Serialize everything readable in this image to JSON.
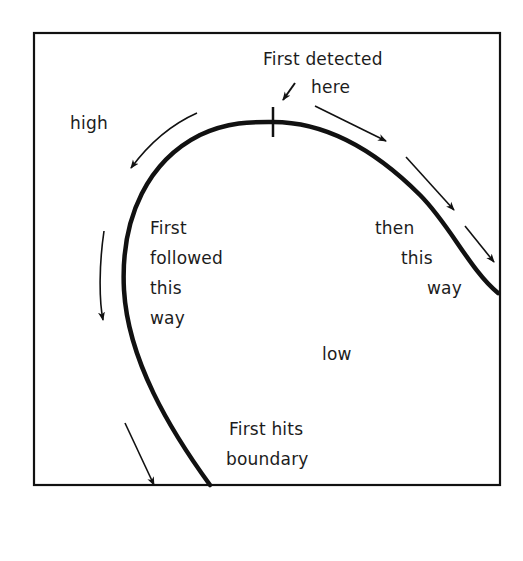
{
  "diagram": {
    "title": "",
    "labels": {
      "high": "high",
      "low": "low",
      "first_detected": [
        "First detected",
        "here"
      ],
      "first_followed": [
        "First",
        "followed",
        "this",
        "way"
      ],
      "then_this_way": [
        "then",
        "this",
        "way"
      ],
      "first_hits_boundary": [
        "First hits",
        "boundary"
      ]
    },
    "elements": {
      "frame": "bounding-box",
      "curve": "contour-line",
      "tick_mark": "detection-point-marker",
      "arrows": [
        "arrow-detection-pointer",
        "arrow-left-upper",
        "arrow-left-middle",
        "arrow-left-lower",
        "arrow-right-upper",
        "arrow-right-middle",
        "arrow-right-lower"
      ]
    },
    "colors": {
      "line": "#111111",
      "background": "#ffffff",
      "text": "#1c1c1c"
    }
  }
}
